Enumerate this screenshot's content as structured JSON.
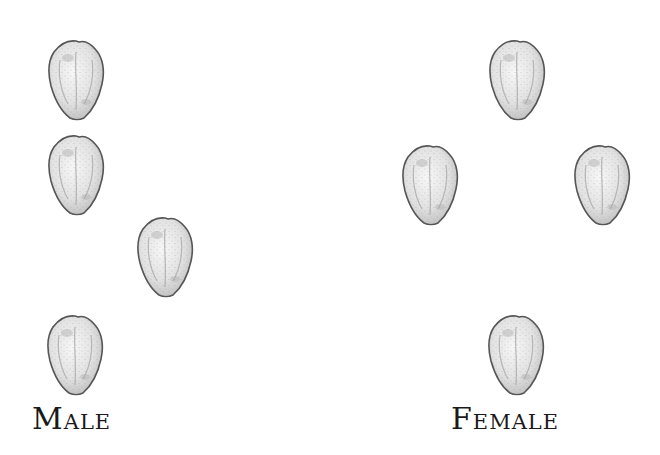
{
  "groups": [
    {
      "id": "male",
      "label": "Male",
      "seed_count": 4,
      "arrangement": "line-of-three-with-one-offset"
    },
    {
      "id": "female",
      "label": "Female",
      "seed_count": 4,
      "arrangement": "diamond"
    }
  ],
  "icons": {
    "seed": "seed-icon"
  },
  "colors": {
    "outline": "#555555",
    "fill": "#eeeeee",
    "shade": "#bdbdbd",
    "text": "#1a1a1a",
    "background": "#ffffff"
  }
}
